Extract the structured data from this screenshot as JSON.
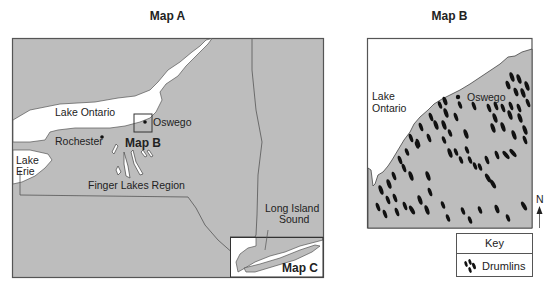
{
  "map_a": {
    "title": "Map A",
    "labels": {
      "lake_ontario": "Lake Ontario",
      "oswego": "Oswego",
      "rochester": "Rochester",
      "map_b_inset": "Map B",
      "lake_erie_1": "Lake",
      "lake_erie_2": "Erie",
      "finger_lakes": "Finger Lakes Region",
      "long_island_1": "Long Island",
      "long_island_2": "Sound",
      "map_c_inset": "Map C"
    }
  },
  "map_b": {
    "title": "Map B",
    "labels": {
      "lake_1": "Lake",
      "lake_2": "Ontario",
      "oswego": "Oswego",
      "north": "N"
    }
  },
  "key": {
    "title": "Key",
    "items": [
      {
        "symbol": "drumlin-icon",
        "label": "Drumlins"
      }
    ]
  },
  "colors": {
    "land": "#bdbdbd",
    "water": "#ffffff",
    "border": "#555555",
    "drumlin": "#111111"
  }
}
